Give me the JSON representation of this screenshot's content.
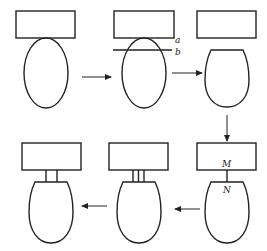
{
  "diagram": {
    "colors": {
      "stroke": "#222222",
      "background": "#ffffff"
    },
    "labels": {
      "a": "a",
      "b": "b",
      "M": "M",
      "N": "N"
    },
    "steps": [
      {
        "id": 1,
        "desc": "rectangle above full ellipse touching it"
      },
      {
        "id": 2,
        "desc": "rectangle overlapping ellipse with cut line a-b"
      },
      {
        "id": 3,
        "desc": "ellipse truncated at cut line"
      },
      {
        "id": 4,
        "desc": "rectangle joined to truncated body at M-N by single line"
      },
      {
        "id": 5,
        "desc": "rectangle joined to body by triple-line stem"
      },
      {
        "id": 6,
        "desc": "rectangle joined to body by double-line stem"
      }
    ],
    "arrows": [
      {
        "from": 1,
        "to": 2,
        "direction": "right"
      },
      {
        "from": 2,
        "to": 3,
        "direction": "right"
      },
      {
        "from": 3,
        "to": 4,
        "direction": "down"
      },
      {
        "from": 4,
        "to": 5,
        "direction": "left"
      },
      {
        "from": 5,
        "to": 6,
        "direction": "left"
      }
    ]
  }
}
